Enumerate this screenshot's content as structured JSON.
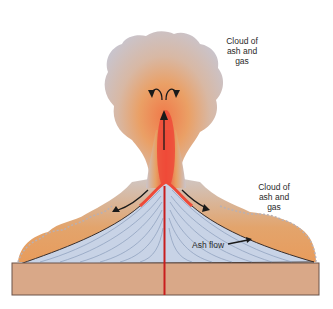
{
  "diagram": {
    "labels": {
      "upper_cloud": [
        "Cloud of",
        "ash and",
        "gas"
      ],
      "side_cloud": [
        "Cloud of",
        "ash and",
        "gas"
      ],
      "ash_flow": "Ash flow"
    },
    "colors": {
      "cloud_gray": "#c9c4cc",
      "cloud_orange": "#e8a062",
      "magma_red": "#e8483a",
      "cone_blue": "#c8d3e6",
      "cone_lines": "#8a9cba",
      "ground": "#d9a888",
      "ground_border": "#6a5248",
      "conduit": "#c81e1e",
      "arrow": "#1a1a1a"
    }
  }
}
